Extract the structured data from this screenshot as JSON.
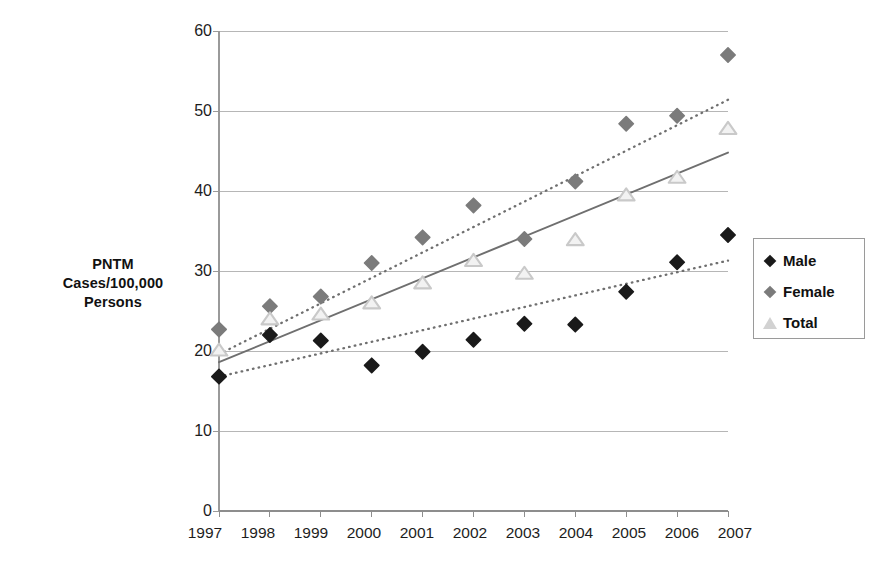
{
  "chart_data": {
    "type": "scatter",
    "title": "",
    "xlabel": "",
    "ylabel": "PNTM Cases/100,000 Persons",
    "categories": [
      "1997",
      "1998",
      "1999",
      "2000",
      "2001",
      "2002",
      "2003",
      "2004",
      "2005",
      "2006",
      "2007"
    ],
    "ylim": [
      0,
      60
    ],
    "yticks": [
      0,
      10,
      20,
      30,
      40,
      50,
      60
    ],
    "grid": "horizontal",
    "legend_position": "right",
    "series": [
      {
        "name": "Male",
        "marker": "diamond",
        "color": "#1a1a1a",
        "values": [
          16.8,
          22.0,
          21.3,
          18.2,
          19.9,
          21.4,
          23.4,
          23.3,
          27.4,
          31.1,
          34.5
        ]
      },
      {
        "name": "Female",
        "marker": "diamond",
        "color": "#7b7b7b",
        "values": [
          22.7,
          25.6,
          26.8,
          31.0,
          34.2,
          38.2,
          34.0,
          41.2,
          48.4,
          49.4,
          57.0
        ]
      },
      {
        "name": "Total",
        "marker": "triangle",
        "color": "#c9c9c9",
        "values": [
          20.0,
          23.9,
          24.5,
          25.9,
          28.4,
          31.2,
          29.6,
          33.8,
          39.4,
          41.6,
          47.7
        ]
      }
    ],
    "trendlines": [
      {
        "name": "Female trend",
        "style": "dotted",
        "color": "#6f6f6f",
        "from": [
          1997,
          19.6
        ],
        "to": [
          2007,
          51.4
        ]
      },
      {
        "name": "Total trend",
        "style": "solid",
        "color": "#6f6f6f",
        "from": [
          1997,
          18.6
        ],
        "to": [
          2007,
          44.8
        ]
      },
      {
        "name": "Male trend",
        "style": "dotted",
        "color": "#6f6f6f",
        "from": [
          1997,
          16.8
        ],
        "to": [
          2007,
          31.3
        ]
      }
    ]
  },
  "axis": {
    "y_title_lines": [
      "PNTM",
      "Cases/100,000",
      "Persons"
    ],
    "y_labels": [
      "60",
      "50",
      "40",
      "30",
      "20",
      "10",
      "0"
    ],
    "x_labels": [
      "1997",
      "1998",
      "1999",
      "2000",
      "2001",
      "2002",
      "2003",
      "2004",
      "2005",
      "2006",
      "2007"
    ]
  },
  "legend": {
    "items": [
      {
        "label": "Male",
        "marker": "diamond-black"
      },
      {
        "label": "Female",
        "marker": "diamond-gray"
      },
      {
        "label": "Total",
        "marker": "triangle-outline"
      }
    ]
  },
  "colors": {
    "male": "#1a1a1a",
    "female": "#7b7b7b",
    "total": "#c9c9c9",
    "gridline": "#b6b6b6",
    "axis": "#9a9a9a",
    "trend": "#6f6f6f"
  }
}
